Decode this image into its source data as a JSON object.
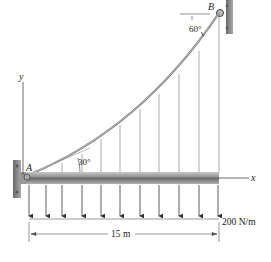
{
  "diagram": {
    "points": {
      "A": "A",
      "B": "B"
    },
    "axes": {
      "x": "x",
      "y": "y"
    },
    "angles": {
      "at_A": "30°",
      "at_B": "60°"
    },
    "load": {
      "intensity": "200 N/m",
      "arrow_count": 11
    },
    "dimension": {
      "span": "15 m"
    },
    "colors": {
      "beam": "#9a9a9a",
      "line": "#333333",
      "wall": "#8a8a8a"
    }
  }
}
